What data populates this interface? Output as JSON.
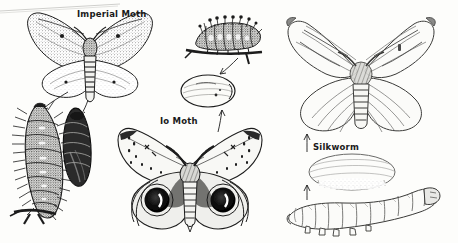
{
  "plate": {
    "title": "Moths and their life stages",
    "background_color": "#fdfdfb",
    "ink_color": "#1d1d1d",
    "medium": "scanned pen-and-ink line engraving"
  },
  "labels": {
    "imperial_moth": "Imperial Moth",
    "io_moth": "Io Moth",
    "silkworm": "Silkworm"
  },
  "figures": [
    {
      "name": "imperial-moth-adult",
      "label": "Imperial Moth",
      "stage": "adult",
      "description": "Large moth with outspread mottled speckled wings and a banded striped abdomen"
    },
    {
      "name": "imperial-moth-larva",
      "stage": "larva",
      "description": "Dark hairy spiny caterpillar clinging to a twig"
    },
    {
      "name": "imperial-moth-pupa",
      "stage": "pupa",
      "description": "Dark elongated chrysalis"
    },
    {
      "name": "io-moth-larva",
      "stage": "larva",
      "description": "Spiny tufted caterpillar resting on a horizontal twig"
    },
    {
      "name": "io-moth-cocoon",
      "stage": "cocoon",
      "description": "Oval papery cocoon"
    },
    {
      "name": "io-moth-adult",
      "label": "Io Moth",
      "stage": "adult",
      "description": "Moth with pale forewings and large black-and-white eyespots on the hindwings"
    },
    {
      "name": "silkworm-moth-adult",
      "stage": "adult",
      "description": "Pale stout silk moth with fan-shaped wings and a banded abdomen"
    },
    {
      "name": "silkworm-cocoon",
      "label": "Silkworm",
      "stage": "cocoon",
      "description": "Oval silk cocoon"
    },
    {
      "name": "silkworm-larva",
      "stage": "larva",
      "description": "Pale segmented silkworm caterpillar with a raised head"
    }
  ],
  "arrows": [
    {
      "name": "arrow-imperial-to-larva",
      "from": "imperial-moth-adult",
      "to": "imperial-moth-larva"
    },
    {
      "name": "arrow-imperial-to-pupa",
      "from": "imperial-moth-adult",
      "to": "imperial-moth-pupa"
    },
    {
      "name": "arrow-io-larva-to-cocoon",
      "from": "io-moth-larva",
      "to": "io-moth-cocoon"
    },
    {
      "name": "arrow-io-cocoon-to-adult",
      "from": "io-moth-cocoon",
      "to": "io-moth-adult"
    },
    {
      "name": "arrow-silkworm-cocoon-to-moth",
      "from": "silkworm-cocoon",
      "to": "silkworm-moth-adult"
    },
    {
      "name": "arrow-silkworm-larva-to-cocoon",
      "from": "silkworm-larva",
      "to": "silkworm-cocoon"
    }
  ]
}
